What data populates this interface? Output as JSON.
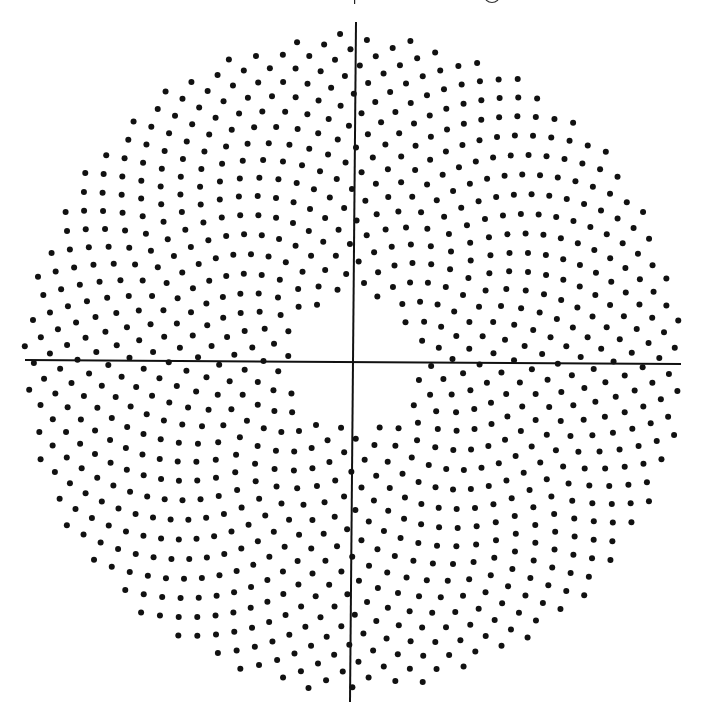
{
  "figure": {
    "type": "phyllotaxis",
    "center": [
      353,
      362
    ],
    "golden_angle_deg": 137.508,
    "scale_c": 10.55,
    "n_start": 38,
    "n_end": 975,
    "dot_radius": 3.0,
    "rotation_deg": 0,
    "colors": {
      "dot": "#111111",
      "axis": "#111111",
      "background": "#ffffff"
    }
  },
  "axes": {
    "horizontal": {
      "x1": 25,
      "y1": 360,
      "x2": 681,
      "y2": 364
    },
    "vertical": {
      "x1": 356,
      "y1": 22,
      "x2": 350,
      "y2": 702
    }
  },
  "header_fragment": {
    "note": "top edge shows cut-off descenders of a page line; not legible"
  }
}
